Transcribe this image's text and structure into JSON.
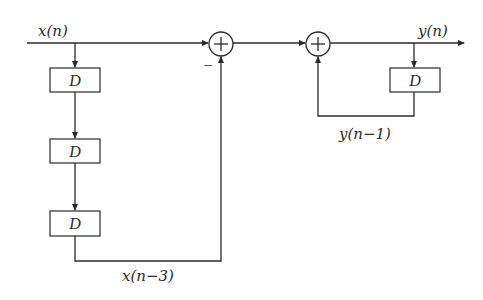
{
  "diagram": {
    "input_label": "x(n)",
    "output_label": "y(n)",
    "delay_label": "D",
    "delays_forward": [
      {
        "label": "D"
      },
      {
        "label": "D"
      },
      {
        "label": "D"
      }
    ],
    "delay_feedback": {
      "label": "D"
    },
    "forward_tap_label": "x(n−3)",
    "feedback_label": "y(n−1)",
    "summer1": {
      "symbol": "+",
      "minus_sign": "−"
    },
    "summer2": {
      "symbol": "+"
    }
  }
}
